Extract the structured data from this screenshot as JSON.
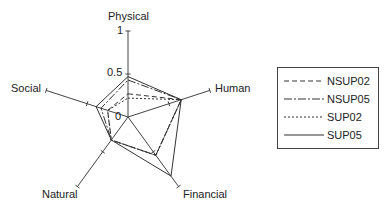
{
  "chart_data": {
    "type": "radar",
    "title": "",
    "axes": [
      "Physical",
      "Human",
      "Financial",
      "Natural",
      "Social"
    ],
    "range": [
      0,
      1
    ],
    "tick_labels": [
      "0",
      "0.5",
      "1"
    ],
    "grid": false,
    "legend_position": "right",
    "series": [
      {
        "name": "NSUP02",
        "style": "dashed",
        "values": [
          0.27,
          0.65,
          0.55,
          0.33,
          0.25
        ]
      },
      {
        "name": "NSUP05",
        "style": "dash-dot",
        "values": [
          0.43,
          0.65,
          0.55,
          0.33,
          0.33
        ]
      },
      {
        "name": "SUP02",
        "style": "dotted",
        "values": [
          0.22,
          0.65,
          0.55,
          0.33,
          0.25
        ]
      },
      {
        "name": "SUP05",
        "style": "solid",
        "values": [
          0.47,
          0.65,
          0.85,
          0.33,
          0.39
        ]
      }
    ]
  },
  "labels": {
    "physical": "Physical",
    "human": "Human",
    "financial": "Financial",
    "natural": "Natural",
    "social": "Social",
    "tick_0": "0",
    "tick_05": "0.5",
    "tick_1": "1"
  },
  "legend": {
    "items": [
      {
        "label": "NSUP02",
        "dash": "5,3"
      },
      {
        "label": "NSUP05",
        "dash": "8,2,2,2"
      },
      {
        "label": "SUP02",
        "dash": "2,2"
      },
      {
        "label": "SUP05",
        "dash": ""
      }
    ]
  }
}
